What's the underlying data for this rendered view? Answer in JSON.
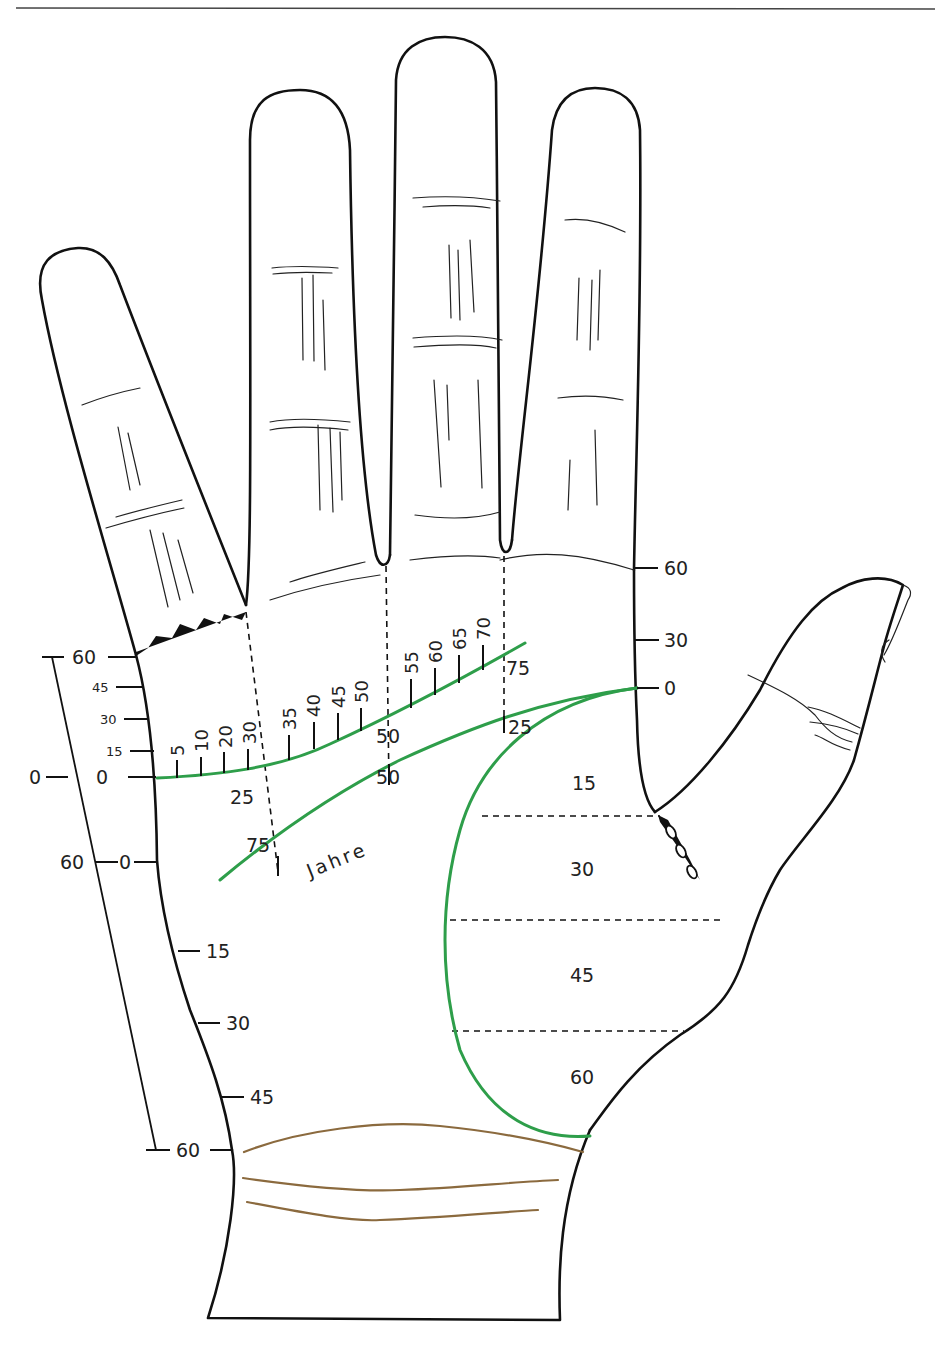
{
  "colors": {
    "life_line": "#2e9e4a",
    "wrist_lines": "#8b6a3e",
    "outline": "#111111"
  },
  "left_scale": {
    "outer_top": "60",
    "outer_zero": "0",
    "outer_60": "60",
    "inner_labels": [
      "60",
      "45",
      "30",
      "15",
      "0"
    ],
    "inner_zero_lower": "0",
    "lower_labels": [
      "15",
      "30",
      "45",
      "60"
    ]
  },
  "heart_line_ages": [
    "5",
    "10",
    "20",
    "30",
    "35",
    "40",
    "45",
    "50",
    "55",
    "60",
    "65",
    "70",
    "75"
  ],
  "head_line_ages": {
    "a25": "25",
    "a50": "50",
    "a75": "75"
  },
  "life_line_ages": {
    "a25": "25",
    "a50": "50",
    "a75": "75"
  },
  "jahre_label": "Jahre",
  "right_scale": [
    "60",
    "30",
    "0"
  ],
  "thumb_mount_labels": [
    "15",
    "30",
    "45",
    "60"
  ]
}
